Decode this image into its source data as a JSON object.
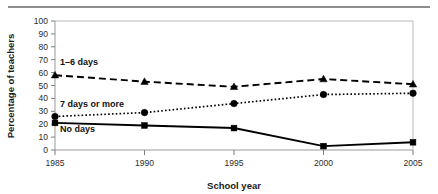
{
  "chart_data": {
    "type": "line",
    "title": "",
    "subtitle": "",
    "xlabel": "School year",
    "ylabel": "Percentage of teachers",
    "categories": [
      "1985",
      "1990",
      "1995",
      "2000",
      "2005"
    ],
    "x": [
      1985,
      1990,
      1995,
      2000,
      2005
    ],
    "xlim": [
      1985,
      2005
    ],
    "ylim": [
      0,
      100
    ],
    "y_ticks": [
      0,
      10,
      20,
      30,
      40,
      50,
      60,
      70,
      80,
      90,
      100
    ],
    "y_tick_labels": [
      "0",
      "10",
      "20",
      "30",
      "40",
      "50",
      "60",
      "70",
      "80",
      "90",
      "100"
    ],
    "x_tick_labels": [
      "1985",
      "1990",
      "1995",
      "2000",
      "2005"
    ],
    "grid": false,
    "legend": "inline-labels",
    "series": [
      {
        "name": "1–6 days",
        "label": "1–6 days",
        "marker": "triangle",
        "linestyle": "dashed",
        "color": "#000000",
        "values": [
          58,
          53,
          49,
          55,
          51
        ]
      },
      {
        "name": "7 days or more",
        "label": "7 days or more",
        "marker": "circle",
        "linestyle": "dotted",
        "color": "#000000",
        "values": [
          26,
          29,
          36,
          43,
          44
        ]
      },
      {
        "name": "No days",
        "label": "No days",
        "marker": "square",
        "linestyle": "solid",
        "color": "#000000",
        "values": [
          21,
          19,
          17,
          3,
          6
        ]
      }
    ],
    "annotations": [
      {
        "text": "1–6 days",
        "x": 1985,
        "y": 66
      },
      {
        "text": "7 days or more",
        "x": 1985,
        "y": 33
      },
      {
        "text": "No days",
        "x": 1985,
        "y": 14
      }
    ]
  },
  "colors": {
    "ink": "#000000",
    "axis": "#9a9a9a",
    "box": "#b9b9b9",
    "rule": "#8d8d8d",
    "background": "#ffffff"
  }
}
